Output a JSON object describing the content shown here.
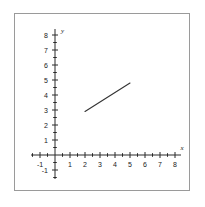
{
  "chart_data": {
    "type": "line",
    "title": "",
    "xlabel": "x",
    "ylabel": "y",
    "xlim": [
      -1.6,
      8.4
    ],
    "ylim": [
      -1.6,
      8.4
    ],
    "grid": false,
    "legend": null,
    "x_ticks": [
      -1,
      1,
      2,
      3,
      4,
      5,
      6,
      7,
      8
    ],
    "y_ticks": [
      -1,
      1,
      2,
      3,
      4,
      5,
      6,
      7,
      8
    ],
    "x_tick_labels": [
      "-1",
      "1",
      "2",
      "3",
      "4",
      "5",
      "6",
      "7",
      "8"
    ],
    "y_tick_labels": [
      "-1",
      "1",
      "2",
      "3",
      "4",
      "5",
      "6",
      "7",
      "8"
    ],
    "minor_tick_step": 0.5,
    "series": [
      {
        "name": "segment",
        "type": "line",
        "color": "#333333",
        "points": [
          {
            "x": 2.0,
            "y": 2.9
          },
          {
            "x": 5.0,
            "y": 4.8
          }
        ],
        "slope": 0.63,
        "intercept": 1.64
      }
    ]
  },
  "figure": {
    "background": "#ffffff",
    "border_color": "#9a9a9a",
    "axis_color": "#2a2a2a",
    "line_color": "#333333",
    "x_axis_label": "x",
    "y_axis_label": "y"
  }
}
